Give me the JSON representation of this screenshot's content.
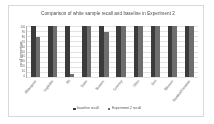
{
  "chart_data": {
    "type": "bar",
    "title": "Comparison of white sample recall and baseline in Experiment 2",
    "xlabel": "",
    "ylabel": "recall percentage",
    "ylim": [
      0,
      100
    ],
    "grid": true,
    "legend_position": "bottom",
    "categories": [
      "Whitespace",
      "Capitalize",
      "PII",
      "Dates",
      "Numeric",
      "Currency",
      "Other",
      "Unit",
      "Measure",
      "Standard Deviation"
    ],
    "series": [
      {
        "name": "baseline recall",
        "values": [
          100,
          100,
          100,
          100,
          100,
          100,
          100,
          100,
          100,
          100
        ]
      },
      {
        "name": "Experiment 2 recall",
        "values": [
          78,
          100,
          6,
          100,
          88,
          100,
          100,
          100,
          100,
          100
        ]
      }
    ],
    "y_ticks": [
      "100",
      "90",
      "80",
      "70",
      "60",
      "50",
      "40",
      "30",
      "20",
      "10",
      "0"
    ],
    "colors": {
      "series0": "#3b3b3b",
      "series1": "#6e6e6e",
      "grid": "#e2e2e2",
      "axis": "#b0b0b0",
      "frame": "#d9d9d9",
      "text": "#555555"
    }
  }
}
